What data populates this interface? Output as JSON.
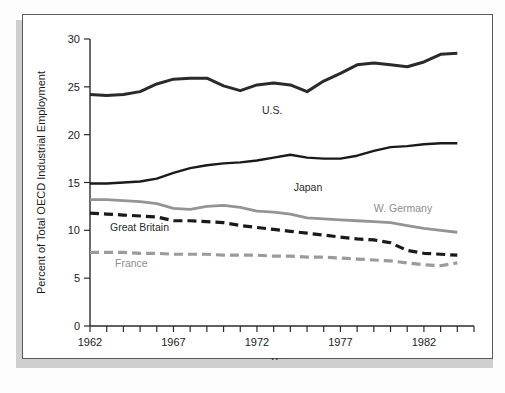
{
  "figure": {
    "frame_color": "#5a5a5a",
    "background": "#ffffff"
  },
  "chart_data": {
    "type": "line",
    "title": "",
    "xlabel": "Year",
    "ylabel": "Percent of Total OECD Industrial Employment",
    "xlim": [
      1962,
      1985
    ],
    "ylim": [
      0,
      30
    ],
    "ytick_values": [
      0,
      5,
      10,
      15,
      20,
      25,
      30
    ],
    "ytick_labels": [
      "0",
      "5",
      "10",
      "15",
      "20",
      "25",
      "30"
    ],
    "xtick_values": [
      1962,
      1963,
      1964,
      1965,
      1966,
      1967,
      1968,
      1969,
      1970,
      1971,
      1972,
      1973,
      1974,
      1975,
      1976,
      1977,
      1978,
      1979,
      1980,
      1981,
      1982,
      1983,
      1984,
      1985
    ],
    "xtick_labeled": [
      1962,
      1967,
      1972,
      1977,
      1982
    ],
    "xtick_labels": [
      "1962",
      "1967",
      "1972",
      "1977",
      "1982"
    ],
    "grid": false,
    "legend": "inline-annotations",
    "x": [
      1962,
      1963,
      1964,
      1965,
      1966,
      1967,
      1968,
      1969,
      1970,
      1971,
      1972,
      1973,
      1974,
      1975,
      1976,
      1977,
      1978,
      1979,
      1980,
      1981,
      1982,
      1983,
      1984
    ],
    "series": [
      {
        "name": "U.S.",
        "label": "U.S.",
        "color": "#2a2a2a",
        "style": "solid",
        "width": 3.0,
        "label_x": 1972.3,
        "label_y": 22.2,
        "values": [
          24.2,
          24.1,
          24.2,
          24.5,
          25.3,
          25.8,
          25.9,
          25.9,
          25.1,
          24.6,
          25.2,
          25.4,
          25.2,
          24.5,
          25.6,
          26.4,
          27.3,
          27.5,
          27.3,
          27.1,
          27.6,
          28.4,
          28.5
        ]
      },
      {
        "name": "Japan",
        "label": "Japan",
        "color": "#1a1a1a",
        "style": "solid",
        "width": 2.4,
        "label_x": 1974.2,
        "label_y": 14.1,
        "values": [
          14.9,
          14.9,
          15.0,
          15.1,
          15.4,
          16.0,
          16.5,
          16.8,
          17.0,
          17.1,
          17.3,
          17.6,
          17.9,
          17.6,
          17.5,
          17.5,
          17.8,
          18.3,
          18.7,
          18.8,
          19.0,
          19.1,
          19.1
        ]
      },
      {
        "name": "W. Germany",
        "label": "W. Germany",
        "color": "#949494",
        "style": "solid",
        "width": 2.8,
        "label_x": 1979.0,
        "label_y": 11.9,
        "values": [
          13.2,
          13.2,
          13.1,
          13.0,
          12.8,
          12.3,
          12.2,
          12.5,
          12.6,
          12.4,
          12.0,
          11.9,
          11.7,
          11.3,
          11.2,
          11.1,
          11.0,
          10.9,
          10.8,
          10.5,
          10.2,
          10.0,
          9.8
        ]
      },
      {
        "name": "Great Britain",
        "label": "Great Britain",
        "color": "#1a1a1a",
        "style": "dashed",
        "width": 3.2,
        "label_x": 1963.2,
        "label_y": 9.9,
        "values": [
          11.8,
          11.7,
          11.6,
          11.5,
          11.4,
          11.0,
          11.0,
          10.9,
          10.8,
          10.5,
          10.3,
          10.1,
          9.9,
          9.7,
          9.5,
          9.3,
          9.1,
          9.0,
          8.7,
          7.9,
          7.6,
          7.5,
          7.4
        ]
      },
      {
        "name": "France",
        "label": "France",
        "color": "#9b9b9b",
        "style": "dashed",
        "width": 3.2,
        "label_x": 1963.5,
        "label_y": 6.2,
        "values": [
          7.7,
          7.7,
          7.7,
          7.6,
          7.6,
          7.5,
          7.5,
          7.5,
          7.4,
          7.4,
          7.4,
          7.3,
          7.3,
          7.2,
          7.2,
          7.1,
          7.0,
          6.9,
          6.8,
          6.6,
          6.4,
          6.3,
          6.6
        ]
      }
    ]
  }
}
